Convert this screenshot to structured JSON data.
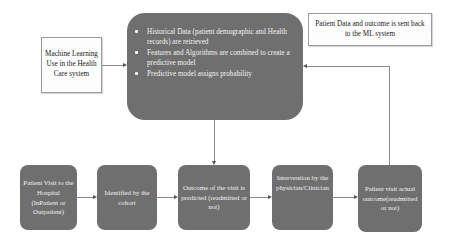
{
  "diagram": {
    "ml_box": {
      "label": "Machine Learning Use in the Health Care system"
    },
    "central_box": {
      "bullets": [
        "Historical Data (patient demographic and Health records) are retrieved",
        "Features and Algorithms are combined to create a predictive model",
        "Predictive model assigns probability"
      ]
    },
    "feedback_box": {
      "label": "Patient Data and outcome is sent back to the ML system"
    },
    "flow_steps": [
      {
        "label": "Patient Visit to the Hospital (InPatient or Outpatient)"
      },
      {
        "label": "Identified by the cohort"
      },
      {
        "label": "Outcome of the visit is predicted (readmitted or not)"
      },
      {
        "label": "Intervention by the physician/Clinician"
      },
      {
        "label": "Patient visit actual outcome(readmitted or not)"
      }
    ],
    "colors": {
      "process_fill": "#6f6f6f",
      "process_text": "#f2f2f2",
      "note_border": "#9a9a9a",
      "connector": "#8a8a8a"
    }
  }
}
